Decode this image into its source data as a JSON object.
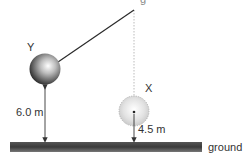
{
  "diagram": {
    "type": "pendulum-heights",
    "pivot_label_partial": "g",
    "balls": [
      {
        "id": "Y",
        "label": "Y",
        "height_label": "6.0 m",
        "style": "solid-dark"
      },
      {
        "id": "X",
        "label": "X",
        "height_label": "4.5 m",
        "style": "dashed-light"
      }
    ],
    "ground_label": "ground",
    "colors": {
      "string": "#2a2a2a",
      "ground_dark": "#333333",
      "ball_y_dark": "#1a1a1a",
      "ball_x_light": "#d8d8d8",
      "text": "#333333"
    }
  }
}
